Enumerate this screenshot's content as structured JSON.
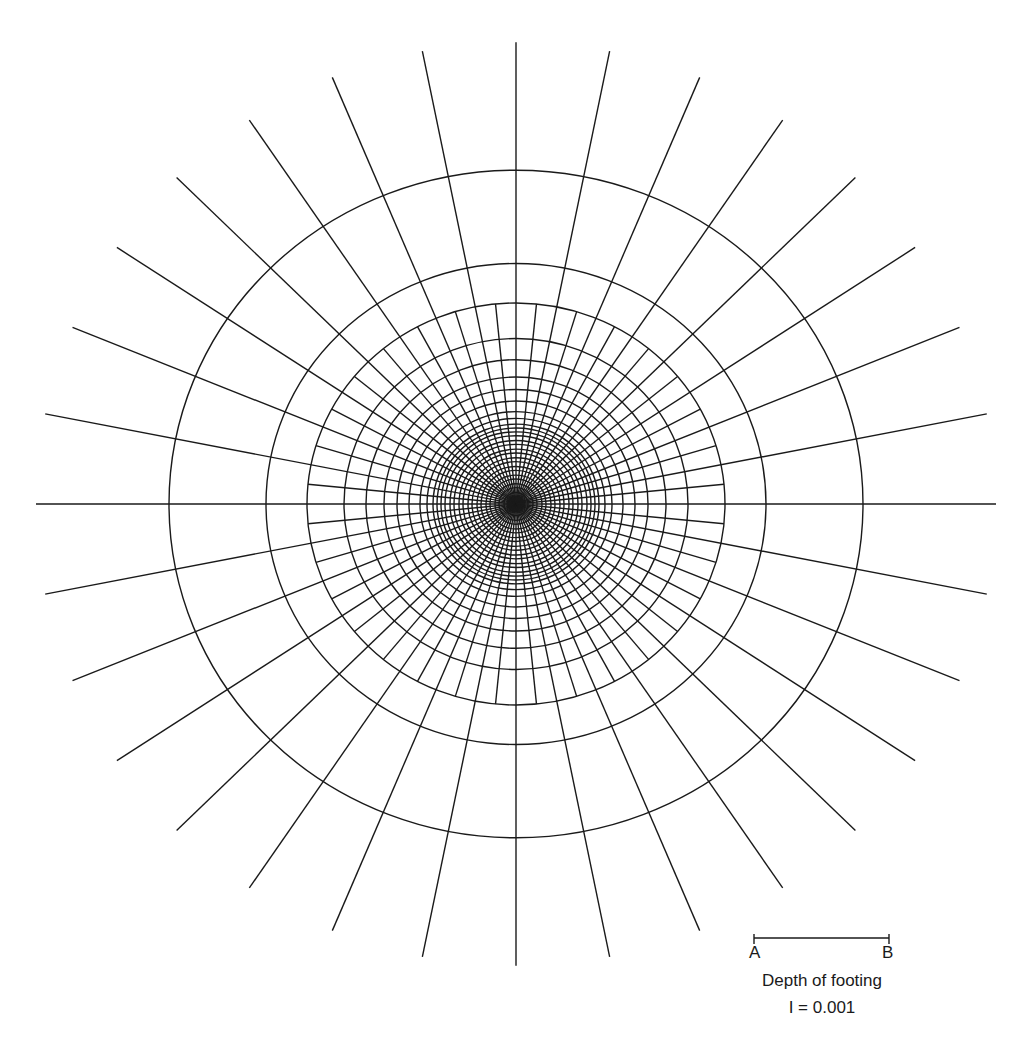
{
  "chart_data": {
    "type": "diagram",
    "center": [
      516,
      504
    ],
    "stroke_color": "#1a1a1a",
    "background": "#ffffff",
    "ellipse_y_scale": 0.962,
    "outer_spokes": {
      "count": 32,
      "length": 480
    },
    "inner_spokes": {
      "count": 64,
      "max_radius": 209
    },
    "center_circle_radius": 4,
    "ring_radii": [
      8,
      12,
      17,
      21,
      26,
      30,
      35,
      39,
      44,
      48,
      53,
      57,
      62,
      66,
      71,
      75,
      79,
      83,
      89,
      96,
      107,
      119,
      132,
      150,
      172,
      209,
      250,
      347
    ],
    "scale_bar": {
      "x1": 754,
      "x2": 889,
      "y": 938,
      "label_start": "A",
      "label_end": "B",
      "caption": "Depth of footing"
    },
    "influence_value_label": "I = 0.001"
  },
  "legend": {
    "a_label": "A",
    "b_label": "B",
    "depth_label": "Depth of footing",
    "influence_label": "I = 0.001"
  }
}
